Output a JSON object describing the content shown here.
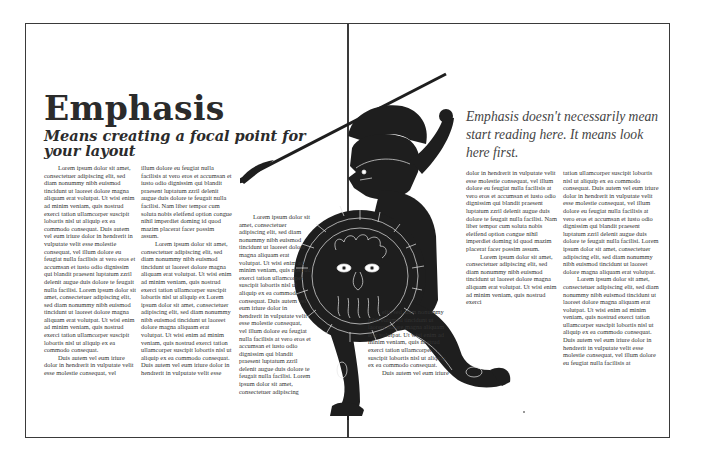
{
  "page": {
    "title": "Emphasis",
    "subtitle": "Means creating a focal point for your layout",
    "pull_quote": "Emphasis doesn't necessarily mean start  reading here. It means look here first."
  },
  "figure": {
    "icon": "greek-warrior-illustration",
    "fill_color": "#1e1e1e",
    "line_color": "#e8e8e8"
  },
  "colors": {
    "frame": "#3a3a3a",
    "heading": "#2b2b2b",
    "body": "#333333",
    "pull_quote": "#444444"
  },
  "columns": [
    {
      "paragraphs": [
        {
          "indent": true,
          "text": "Lorem ipsum dolor sit amet, consectetuer adipiscing elit, sed diam nonummy nibh euismod tincidunt ut laoreet dolore magna aliquam erat volutpat.  Ut wisi enim ad minim veniam, quis nostrud exerci tation ullamcorper suscipit lobortis nisl ut aliquip ex ea commodo consequat.  Duis autem vel eum iriure dolor in hendrerit in vulputate velit esse molestie consequat, vel illum dolore eu feugiat nulla facilisis at vero eros et accumsan et iusto odio dignissim qui blandit praesent luptatum zzril delenit augue duis dolore te feugait nulla facilisi.  Lorem ipsum dolor sit amet, consectetuer adipiscing elit, sed diam nonummy nibh euismod tincidunt ut laoreet dolore magna aliquam erat volutpat.  Ut wisi enim ad minim veniam, quis nostrud exerci tation ullamcorper suscipit lobortis nisl ut aliquip ex ea commodo consequat."
        },
        {
          "indent": true,
          "text": "Duis autem vel eum iriure dolor in hendrerit in vulputate velit esse molestie consequat, vel"
        }
      ]
    },
    {
      "paragraphs": [
        {
          "indent": false,
          "text": "illum dolore eu feugiat nulla facilisis at vero eros et accumsan et iusto odio dignissim qui blandit praesent luptatum zzril delenit augue duis dolore te feugait nulla facilisi. Nam liber tempor cum soluta nobis eleifend option congue nihil imperdiet doming id quod mazim placerat facer possim assum."
        },
        {
          "indent": true,
          "text": "Lorem ipsum dolor sit amet, consectetuer adipiscing elit, sed diam nonummy nibh euismod tincidunt ut laoreet dolore magna aliquam erat volutpat.  Ut wisi enim ad minim veniam, quis nostrud exerci tation ullamcorper suscipit lobortis nisl ut aliquip ex Lorem ipsum dolor sit amet, consectetuer adipiscing elit, sed diam nonummy nibh euismod tincidunt ut laoreet dolore magna aliquam erat volutpat.  Ut wisi enim ad minim veniam, quis nostrud exerci tation ullamcorper suscipit lobortis nisl ut aliquip ex ea commodo consequat.  Duis autem vel eum iriure dolor in hendrerit in vulputate velit esse"
        }
      ]
    },
    {
      "paragraphs": [
        {
          "indent": true,
          "text": "Lorem ipsum dolor sit amet, consectetuer adipiscing elit, sed diam nonummy nibh euismod tincidunt ut laoreet dolore magna aliquam erat volutpat.  Ut wisi enim ad minim veniam, quis nostrud exerci tation ullamcorper suscipit lobortis nisl ut aliquip ex ea commodo consequat.  Duis autem vel eum iriure dolor in hendrerit in vulputate velit esse molestie consequat, vel illum dolore eu feugiat nulla facilisis at vero eros et accumsan et iusto odio dignissim qui blandit praesent luptatum zzril delenit augue duis dolore te feugait nulla facilisi.  Lorem ipsum dolor sit amet, consectetuer adipiscing"
        }
      ]
    },
    {
      "paragraphs": [
        {
          "indent": true,
          "text": "elit, sed diam nonummy nibh euismod tincidunt ut laoreet dolore magna aliquam erat volutpat.  Ut wisi enim ad minim veniam, quis nostrud exerci tation ullamcorper suscipit lobortis nisl ut aliquip ex ea commodo consequat."
        },
        {
          "indent": true,
          "text": "Duis autem vel eum iriure"
        }
      ]
    },
    {
      "paragraphs": [
        {
          "indent": false,
          "text": "dolor in hendrerit in vulputate velit esse molestie consequat, vel illum dolore eu feugiat nulla facilisis at vero eros et accumsan et iusto odio dignissim qui blandit praesent luptatum zzril delenit augue duis dolore te feugait nulla facilisi. Nam liber tempor cum soluta nobis eleifend option congue nihil imperdiet doming id quod mazim placerat facer possim assum."
        },
        {
          "indent": true,
          "text": "Lorem ipsum dolor sit amet, consectetuer adipiscing elit, sed diam nonummy nibh euismod tincidunt ut laoreet dolore magna aliquam erat volutpat.  Ut wisi enim ad minim veniam, quis nostrud exerci"
        }
      ]
    },
    {
      "paragraphs": [
        {
          "indent": false,
          "text": "tation ullamcorper suscipit lobortis nisl ut aliquip ex ea commodo consequat.  Duis autem vel eum iriure dolor in hendrerit in vulputate velit esse molestie consequat, vel illum dolore eu feugiat nulla facilisis at vero eros et accumsan et iusto odio dignissim qui blandit praesent luptatum zzril delenit augue duis dolore te feugait nulla facilisi. Lorem ipsum dolor sit amet, consectetuer adipiscing elit, sed diam nonummy nibh euismod tincidunt ut laoreet dolore magna aliquam erat volutpat."
        },
        {
          "indent": true,
          "text": "Lorem ipsum dolor sit amet, consectetuer adipiscing elit, sed diam nonummy nibh euismod tincidunt ut laoreet dolore magna aliquam erat volutpat.  Ut wisi enim ad minim veniam, quis nostrud exerci tation ullamcorper suscipit lobortis nisl ut aliquip ex ea commodo consequat.  Duis autem vel eum iriure dolor in hendrerit in vulputate velit esse molestie consequat, vel illum dolore eu feugiat nulla facilisis at"
        }
      ]
    }
  ]
}
